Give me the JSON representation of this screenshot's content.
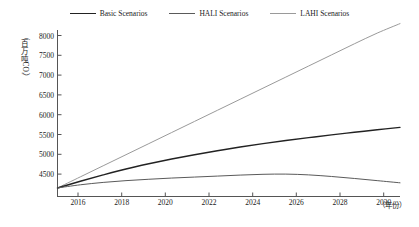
{
  "chart_data": {
    "type": "line",
    "title": "",
    "xlabel": "（年份）",
    "ylabel": "（百万吨CO₂）",
    "ylabel_chars": [
      "（",
      "百",
      "万",
      "吨",
      "CO₂",
      "）"
    ],
    "xlim": [
      2015,
      2030
    ],
    "ylim": [
      4100,
      8400
    ],
    "xticks": [
      2016,
      2018,
      2020,
      2022,
      2024,
      2026,
      2028,
      2030
    ],
    "yticks": [
      4500,
      5000,
      5500,
      6000,
      6500,
      7000,
      7500,
      8000
    ],
    "grid": false,
    "legend_position": "top-center",
    "x": [
      2015,
      2016,
      2017,
      2018,
      2019,
      2020,
      2021,
      2022,
      2023,
      2024,
      2025,
      2026,
      2027,
      2028,
      2029,
      2030
    ],
    "series": [
      {
        "name": "Basic Scenarios",
        "color": "#222222",
        "width": 1.4,
        "values": [
          4150,
          4320,
          4480,
          4630,
          4760,
          4880,
          4990,
          5090,
          5185,
          5270,
          5350,
          5420,
          5490,
          5555,
          5620,
          5680
        ]
      },
      {
        "name": "HALI Scenarios",
        "color": "#5a5a5a",
        "width": 1.0,
        "values": [
          4150,
          4230,
          4290,
          4335,
          4370,
          4400,
          4425,
          4450,
          4475,
          4495,
          4500,
          4480,
          4440,
          4390,
          4335,
          4280
        ]
      },
      {
        "name": "LAHI Scenarios",
        "color": "#9a9a9a",
        "width": 1.0,
        "values": [
          4150,
          4430,
          4710,
          4990,
          5270,
          5550,
          5830,
          6110,
          6390,
          6670,
          6950,
          7230,
          7510,
          7790,
          8060,
          8300
        ]
      }
    ]
  },
  "legend": {
    "items": [
      {
        "label": "Basic Scenarios",
        "color": "#222222",
        "width": "1.4px"
      },
      {
        "label": "HALI Scenarios",
        "color": "#5a5a5a",
        "width": "1.1px"
      },
      {
        "label": "LAHI Scenarios",
        "color": "#9a9a9a",
        "width": "1px"
      }
    ]
  },
  "axes": {
    "y_tick_labels": [
      "8000",
      "7500",
      "7000",
      "6500",
      "6000",
      "5500",
      "5000",
      "4500"
    ],
    "x_tick_labels": [
      "2016",
      "2018",
      "2020",
      "2022",
      "2024",
      "2026",
      "2028",
      "2030"
    ],
    "axis_color": "#555555"
  }
}
